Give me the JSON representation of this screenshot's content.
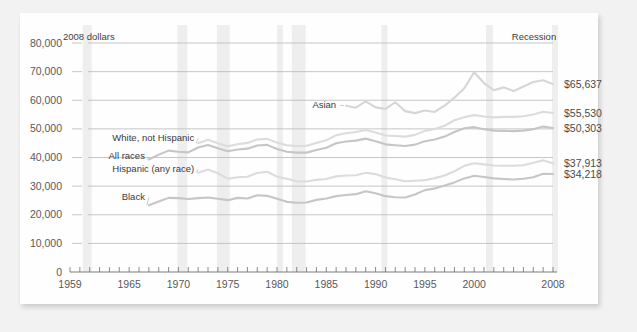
{
  "figure": {
    "units_label": "2008 dollars",
    "recession_label": "Recession",
    "background_color": "#f2f2f2",
    "card_color": "#fefefe"
  },
  "chart_data": {
    "type": "line",
    "title": "",
    "xlabel": "",
    "ylabel": "2008 dollars",
    "xlim": [
      1959,
      2008
    ],
    "ylim": [
      0,
      80000
    ],
    "grid": true,
    "legend_position": "inline-labels",
    "y_ticks": [
      0,
      10000,
      20000,
      30000,
      40000,
      50000,
      60000,
      70000,
      80000
    ],
    "y_tick_labels": [
      "0",
      "10,000",
      "20,000",
      "30,000",
      "40,000",
      "50,000",
      "60,000",
      "70,000",
      "80,000"
    ],
    "x_ticks": [
      1959,
      1960,
      1961,
      1962,
      1963,
      1964,
      1965,
      1966,
      1967,
      1968,
      1969,
      1970,
      1971,
      1972,
      1973,
      1974,
      1975,
      1976,
      1977,
      1978,
      1979,
      1980,
      1981,
      1982,
      1983,
      1984,
      1985,
      1986,
      1987,
      1988,
      1989,
      1990,
      1991,
      1992,
      1993,
      1994,
      1995,
      1996,
      1997,
      1998,
      1999,
      2000,
      2001,
      2002,
      2003,
      2004,
      2005,
      2006,
      2007,
      2008
    ],
    "x_tick_labels": [
      {
        "year": 1959,
        "label": "1959"
      },
      {
        "year": 1965,
        "label": "1965"
      },
      {
        "year": 1970,
        "label": "1970"
      },
      {
        "year": 1975,
        "label": "1975"
      },
      {
        "year": 1980,
        "label": "1980"
      },
      {
        "year": 1985,
        "label": "1985"
      },
      {
        "year": 1990,
        "label": "1990"
      },
      {
        "year": 1995,
        "label": "1995"
      },
      {
        "year": 2000,
        "label": "2000"
      },
      {
        "year": 2008,
        "label": "2008"
      }
    ],
    "recession_bands": [
      {
        "start": 1960.3,
        "end": 1961.2
      },
      {
        "start": 1969.9,
        "end": 1970.9
      },
      {
        "start": 1973.9,
        "end": 1975.2
      },
      {
        "start": 1980.0,
        "end": 1980.6
      },
      {
        "start": 1981.5,
        "end": 1982.9
      },
      {
        "start": 1990.6,
        "end": 1991.2
      },
      {
        "start": 2001.2,
        "end": 2001.9
      },
      {
        "start": 2007.9,
        "end": 2008.5
      }
    ],
    "series": [
      {
        "name": "Asian",
        "label": "Asian",
        "color": "#d6d6d8",
        "end_value_label": "$65,637",
        "start_year": 1987,
        "values": [
          {
            "year": 1987,
            "value": 58100
          },
          {
            "year": 1988,
            "value": 57400
          },
          {
            "year": 1989,
            "value": 59600
          },
          {
            "year": 1990,
            "value": 57500
          },
          {
            "year": 1991,
            "value": 57000
          },
          {
            "year": 1992,
            "value": 59300
          },
          {
            "year": 1993,
            "value": 56200
          },
          {
            "year": 1994,
            "value": 55500
          },
          {
            "year": 1995,
            "value": 56400
          },
          {
            "year": 1996,
            "value": 55900
          },
          {
            "year": 1997,
            "value": 58100
          },
          {
            "year": 1998,
            "value": 60900
          },
          {
            "year": 1999,
            "value": 64200
          },
          {
            "year": 2000,
            "value": 69800
          },
          {
            "year": 2001,
            "value": 66000
          },
          {
            "year": 2002,
            "value": 63500
          },
          {
            "year": 2003,
            "value": 64500
          },
          {
            "year": 2004,
            "value": 63200
          },
          {
            "year": 2005,
            "value": 64800
          },
          {
            "year": 2006,
            "value": 66400
          },
          {
            "year": 2007,
            "value": 67000
          },
          {
            "year": 2008,
            "value": 65637
          }
        ]
      },
      {
        "name": "White, not Hispanic",
        "label": "White, not Hispanic",
        "color": "#dcdcde",
        "end_value_label": "$55,530",
        "start_year": 1972,
        "values": [
          {
            "year": 1972,
            "value": 45000
          },
          {
            "year": 1973,
            "value": 46200
          },
          {
            "year": 1974,
            "value": 45000
          },
          {
            "year": 1975,
            "value": 43900
          },
          {
            "year": 1976,
            "value": 44600
          },
          {
            "year": 1977,
            "value": 45100
          },
          {
            "year": 1978,
            "value": 46300
          },
          {
            "year": 1979,
            "value": 46500
          },
          {
            "year": 1980,
            "value": 45200
          },
          {
            "year": 1981,
            "value": 44300
          },
          {
            "year": 1982,
            "value": 44000
          },
          {
            "year": 1983,
            "value": 44100
          },
          {
            "year": 1984,
            "value": 45100
          },
          {
            "year": 1985,
            "value": 46000
          },
          {
            "year": 1986,
            "value": 47800
          },
          {
            "year": 1987,
            "value": 48500
          },
          {
            "year": 1988,
            "value": 48900
          },
          {
            "year": 1989,
            "value": 49600
          },
          {
            "year": 1990,
            "value": 48700
          },
          {
            "year": 1991,
            "value": 47700
          },
          {
            "year": 1992,
            "value": 47500
          },
          {
            "year": 1993,
            "value": 47300
          },
          {
            "year": 1994,
            "value": 47900
          },
          {
            "year": 1995,
            "value": 49300
          },
          {
            "year": 1996,
            "value": 50000
          },
          {
            "year": 1997,
            "value": 51100
          },
          {
            "year": 1998,
            "value": 53000
          },
          {
            "year": 1999,
            "value": 54100
          },
          {
            "year": 2000,
            "value": 54800
          },
          {
            "year": 2001,
            "value": 54300
          },
          {
            "year": 2002,
            "value": 54000
          },
          {
            "year": 2003,
            "value": 54200
          },
          {
            "year": 2004,
            "value": 54200
          },
          {
            "year": 2005,
            "value": 54400
          },
          {
            "year": 2006,
            "value": 55000
          },
          {
            "year": 2007,
            "value": 56000
          },
          {
            "year": 2008,
            "value": 55530
          }
        ]
      },
      {
        "name": "All races",
        "label": "All races",
        "color": "#c6c6c8",
        "end_value_label": "$50,303",
        "start_year": 1967,
        "values": [
          {
            "year": 1967,
            "value": 39300
          },
          {
            "year": 1968,
            "value": 41000
          },
          {
            "year": 1969,
            "value": 42400
          },
          {
            "year": 1970,
            "value": 42000
          },
          {
            "year": 1971,
            "value": 41800
          },
          {
            "year": 1972,
            "value": 43500
          },
          {
            "year": 1973,
            "value": 44400
          },
          {
            "year": 1974,
            "value": 43200
          },
          {
            "year": 1975,
            "value": 42200
          },
          {
            "year": 1976,
            "value": 42800
          },
          {
            "year": 1977,
            "value": 43100
          },
          {
            "year": 1978,
            "value": 44200
          },
          {
            "year": 1979,
            "value": 44400
          },
          {
            "year": 1980,
            "value": 43000
          },
          {
            "year": 1981,
            "value": 42000
          },
          {
            "year": 1982,
            "value": 41700
          },
          {
            "year": 1983,
            "value": 41700
          },
          {
            "year": 1984,
            "value": 42600
          },
          {
            "year": 1985,
            "value": 43400
          },
          {
            "year": 1986,
            "value": 45000
          },
          {
            "year": 1987,
            "value": 45600
          },
          {
            "year": 1988,
            "value": 45900
          },
          {
            "year": 1989,
            "value": 46600
          },
          {
            "year": 1990,
            "value": 45700
          },
          {
            "year": 1991,
            "value": 44600
          },
          {
            "year": 1992,
            "value": 44300
          },
          {
            "year": 1993,
            "value": 44000
          },
          {
            "year": 1994,
            "value": 44500
          },
          {
            "year": 1995,
            "value": 45700
          },
          {
            "year": 1996,
            "value": 46300
          },
          {
            "year": 1997,
            "value": 47300
          },
          {
            "year": 1998,
            "value": 48900
          },
          {
            "year": 1999,
            "value": 50200
          },
          {
            "year": 2000,
            "value": 50600
          },
          {
            "year": 2001,
            "value": 49900
          },
          {
            "year": 2002,
            "value": 49400
          },
          {
            "year": 2003,
            "value": 49300
          },
          {
            "year": 2004,
            "value": 49200
          },
          {
            "year": 2005,
            "value": 49400
          },
          {
            "year": 2006,
            "value": 49900
          },
          {
            "year": 2007,
            "value": 50800
          },
          {
            "year": 2008,
            "value": 50303
          }
        ]
      },
      {
        "name": "Hispanic (any race)",
        "label": "Hispanic (any race)",
        "color": "#dcdcde",
        "end_value_label": "$37,913",
        "start_year": 1972,
        "values": [
          {
            "year": 1972,
            "value": 34700
          },
          {
            "year": 1973,
            "value": 35800
          },
          {
            "year": 1974,
            "value": 34500
          },
          {
            "year": 1975,
            "value": 32600
          },
          {
            "year": 1976,
            "value": 33100
          },
          {
            "year": 1977,
            "value": 33300
          },
          {
            "year": 1978,
            "value": 34600
          },
          {
            "year": 1979,
            "value": 35000
          },
          {
            "year": 1980,
            "value": 33300
          },
          {
            "year": 1981,
            "value": 32600
          },
          {
            "year": 1982,
            "value": 31700
          },
          {
            "year": 1983,
            "value": 31600
          },
          {
            "year": 1984,
            "value": 32200
          },
          {
            "year": 1985,
            "value": 32500
          },
          {
            "year": 1986,
            "value": 33400
          },
          {
            "year": 1987,
            "value": 33700
          },
          {
            "year": 1988,
            "value": 33800
          },
          {
            "year": 1989,
            "value": 34700
          },
          {
            "year": 1990,
            "value": 34200
          },
          {
            "year": 1991,
            "value": 33000
          },
          {
            "year": 1992,
            "value": 32400
          },
          {
            "year": 1993,
            "value": 31700
          },
          {
            "year": 1994,
            "value": 31900
          },
          {
            "year": 1995,
            "value": 32100
          },
          {
            "year": 1996,
            "value": 32800
          },
          {
            "year": 1997,
            "value": 33700
          },
          {
            "year": 1998,
            "value": 35200
          },
          {
            "year": 1999,
            "value": 37100
          },
          {
            "year": 2000,
            "value": 38000
          },
          {
            "year": 2001,
            "value": 37600
          },
          {
            "year": 2002,
            "value": 37200
          },
          {
            "year": 2003,
            "value": 37100
          },
          {
            "year": 2004,
            "value": 37100
          },
          {
            "year": 2005,
            "value": 37300
          },
          {
            "year": 2006,
            "value": 38200
          },
          {
            "year": 2007,
            "value": 39000
          },
          {
            "year": 2008,
            "value": 37913
          }
        ]
      },
      {
        "name": "Black",
        "label": "Black",
        "color": "#c6c6c8",
        "end_value_label": "$34,218",
        "start_year": 1967,
        "values": [
          {
            "year": 1967,
            "value": 23300
          },
          {
            "year": 1968,
            "value": 24600
          },
          {
            "year": 1969,
            "value": 25900
          },
          {
            "year": 1970,
            "value": 25800
          },
          {
            "year": 1971,
            "value": 25500
          },
          {
            "year": 1972,
            "value": 25800
          },
          {
            "year": 1973,
            "value": 26000
          },
          {
            "year": 1974,
            "value": 25600
          },
          {
            "year": 1975,
            "value": 25100
          },
          {
            "year": 1976,
            "value": 25900
          },
          {
            "year": 1977,
            "value": 25700
          },
          {
            "year": 1978,
            "value": 26800
          },
          {
            "year": 1979,
            "value": 26600
          },
          {
            "year": 1980,
            "value": 25600
          },
          {
            "year": 1981,
            "value": 24500
          },
          {
            "year": 1982,
            "value": 24200
          },
          {
            "year": 1983,
            "value": 24300
          },
          {
            "year": 1984,
            "value": 25200
          },
          {
            "year": 1985,
            "value": 25700
          },
          {
            "year": 1986,
            "value": 26500
          },
          {
            "year": 1987,
            "value": 26900
          },
          {
            "year": 1988,
            "value": 27200
          },
          {
            "year": 1989,
            "value": 28200
          },
          {
            "year": 1990,
            "value": 27500
          },
          {
            "year": 1991,
            "value": 26500
          },
          {
            "year": 1992,
            "value": 26100
          },
          {
            "year": 1993,
            "value": 26000
          },
          {
            "year": 1994,
            "value": 27100
          },
          {
            "year": 1995,
            "value": 28600
          },
          {
            "year": 1996,
            "value": 29200
          },
          {
            "year": 1997,
            "value": 30200
          },
          {
            "year": 1998,
            "value": 31300
          },
          {
            "year": 1999,
            "value": 32700
          },
          {
            "year": 2000,
            "value": 33600
          },
          {
            "year": 2001,
            "value": 33200
          },
          {
            "year": 2002,
            "value": 32700
          },
          {
            "year": 2003,
            "value": 32500
          },
          {
            "year": 2004,
            "value": 32300
          },
          {
            "year": 2005,
            "value": 32600
          },
          {
            "year": 2006,
            "value": 33100
          },
          {
            "year": 2007,
            "value": 34300
          },
          {
            "year": 2008,
            "value": 34218
          }
        ]
      }
    ],
    "inline_label_anchors": [
      {
        "series": "Asian",
        "x": 1986.0,
        "y": 58600
      },
      {
        "series": "White, not Hispanic",
        "x": 1971.6,
        "y": 46900
      },
      {
        "series": "All races",
        "x": 1966.6,
        "y": 40500
      },
      {
        "series": "Hispanic (any race)",
        "x": 1971.6,
        "y": 36200
      },
      {
        "series": "Black",
        "x": 1966.6,
        "y": 26400
      }
    ]
  }
}
